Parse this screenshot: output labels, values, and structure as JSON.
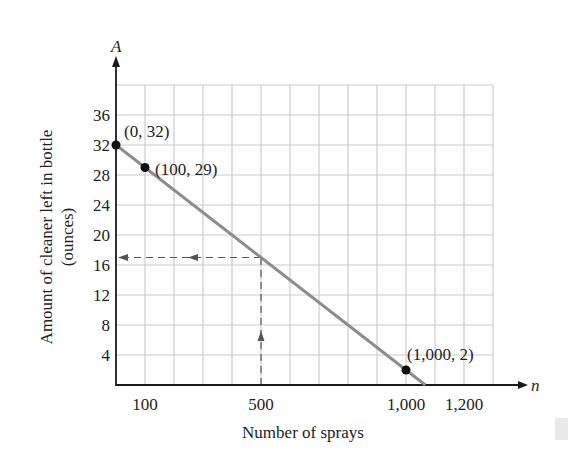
{
  "chart_data": {
    "type": "line",
    "title": "",
    "xlabel": "Number of sprays",
    "ylabel": [
      "Amount of cleaner left in bottle",
      "(ounces)"
    ],
    "x_axis_variable": "n",
    "y_axis_variable": "A",
    "xlim": [
      0,
      1300
    ],
    "ylim": [
      0,
      40
    ],
    "x_grid_step": 100,
    "y_grid_step": 4,
    "grid": true,
    "x_ticks": [
      {
        "value": 100,
        "label": "100"
      },
      {
        "value": 500,
        "label": "500"
      },
      {
        "value": 1000,
        "label": "1,000"
      },
      {
        "value": 1200,
        "label": "1,200"
      }
    ],
    "y_ticks": [
      {
        "value": 4,
        "label": "4"
      },
      {
        "value": 8,
        "label": "8"
      },
      {
        "value": 12,
        "label": "12"
      },
      {
        "value": 16,
        "label": "16"
      },
      {
        "value": 20,
        "label": "20"
      },
      {
        "value": 24,
        "label": "24"
      },
      {
        "value": 28,
        "label": "28"
      },
      {
        "value": 32,
        "label": "32"
      },
      {
        "value": 36,
        "label": "36"
      }
    ],
    "series": [
      {
        "name": "A = 32 - 0.03n",
        "line": {
          "x": [
            0,
            1066.7
          ],
          "y": [
            32,
            0
          ]
        },
        "color": "#8c8c8c"
      }
    ],
    "points": [
      {
        "x": 0,
        "y": 32,
        "label": "(0, 32)"
      },
      {
        "x": 100,
        "y": 29,
        "label": "(100, 29)"
      },
      {
        "x": 1000,
        "y": 2,
        "label": "(1,000, 2)"
      }
    ],
    "annotations": [
      {
        "type": "dashed-guide",
        "from": [
          500,
          0
        ],
        "to": [
          500,
          17
        ],
        "direction": "up"
      },
      {
        "type": "dashed-guide",
        "from": [
          500,
          17
        ],
        "to": [
          0,
          17
        ],
        "direction": "left"
      }
    ]
  },
  "colors": {
    "grid": "#cccccc",
    "axis": "#1a1a1a",
    "line": "#8c8c8c",
    "point": "#111111",
    "guide": "#555555",
    "text": "#222222"
  }
}
